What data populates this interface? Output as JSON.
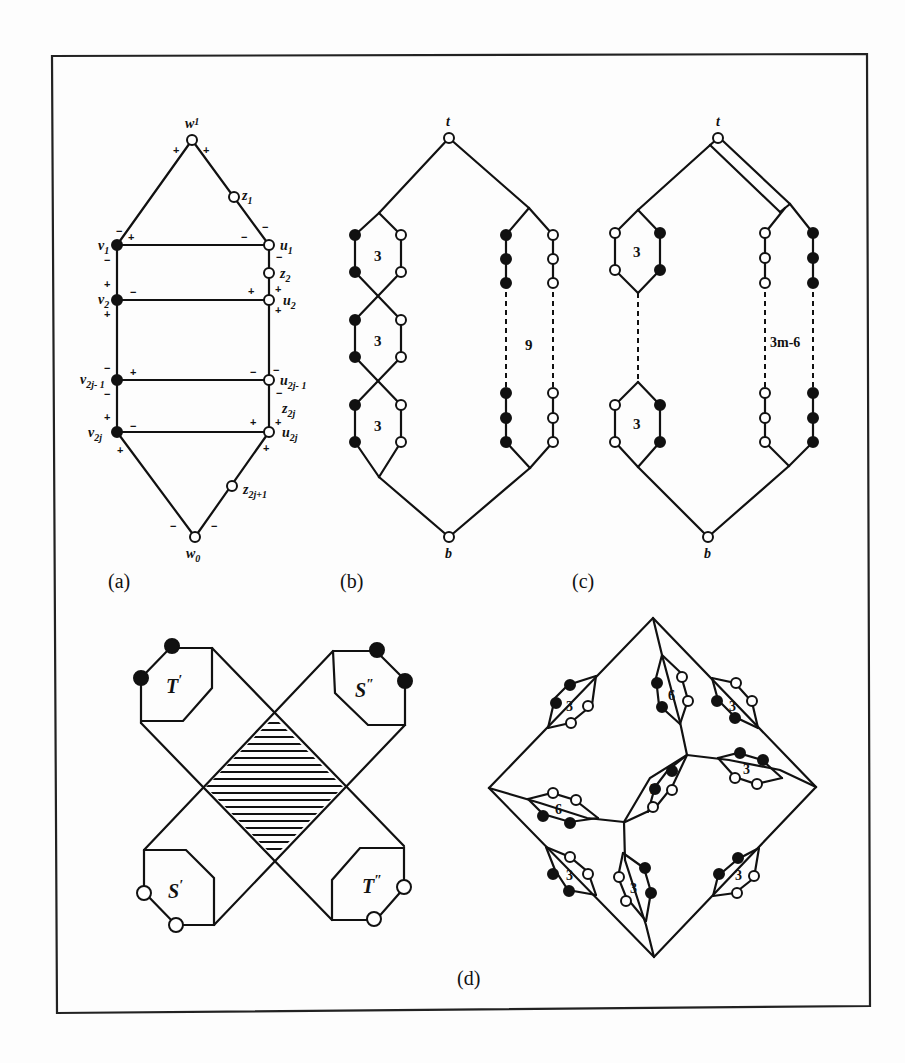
{
  "figure": {
    "panel_labels": {
      "a": "(a)",
      "b": "(b)",
      "c": "(c)",
      "d": "(d)"
    },
    "panel_a": {
      "vertex_labels": {
        "w1": "w",
        "w1_sub": "1",
        "z1": "z",
        "z1_sub": "1",
        "v1": "v",
        "v1_sub": "1",
        "u1": "u",
        "u1_sub": "1",
        "z2": "z",
        "z2_sub": "2",
        "v2": "v",
        "v2_sub": "2",
        "u2": "u",
        "u2_sub": "2",
        "v2j1": "v",
        "v2j1_sub": "2j- 1",
        "u2j1": "u",
        "u2j1_sub": "2j- 1",
        "z2j": "z",
        "z2j_sub": "2j",
        "v2j": "v",
        "v2j_sub": "2j",
        "u2j": "u",
        "u2j_sub": "2j",
        "z2j1": "z",
        "z2j1_sub": "2j+1",
        "w0": "w",
        "w0_sub": "0"
      },
      "signs": {
        "plus": "+",
        "minus": "−"
      }
    },
    "panel_b": {
      "top": "t",
      "bottom": "b",
      "cells": [
        "3",
        "3",
        "3"
      ],
      "chain_count": "9"
    },
    "panel_c": {
      "top": "t",
      "bottom": "b",
      "cells": [
        "3",
        "3"
      ],
      "chain_count": "3m-6"
    },
    "panel_d_left": {
      "labels": {
        "tl": "T",
        "tl_mark": "′",
        "tr": "S",
        "tr_mark": "″",
        "bl": "S",
        "bl_mark": "′",
        "br": "T",
        "br_mark": "″"
      }
    },
    "panel_d_right": {
      "cells": [
        "3",
        "6",
        "3",
        "3",
        "3",
        "6",
        "3",
        "3",
        "3"
      ]
    }
  }
}
